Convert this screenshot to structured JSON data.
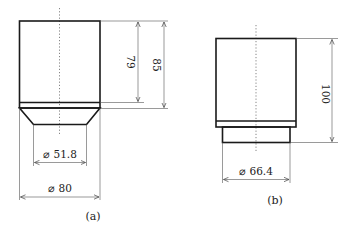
{
  "figure_a": {
    "caption": "(a)",
    "dimensions": {
      "height_inner": "79",
      "height_total": "85",
      "diameter_bottom": "⌀ 51.8",
      "diameter_body": "⌀ 80"
    }
  },
  "figure_b": {
    "caption": "(b)",
    "dimensions": {
      "height_total": "100",
      "diameter_bottom": "⌀ 66.4"
    }
  },
  "colors": {
    "outline": "#1a1a1a",
    "dimension": "#555555",
    "background": "#ffffff"
  }
}
